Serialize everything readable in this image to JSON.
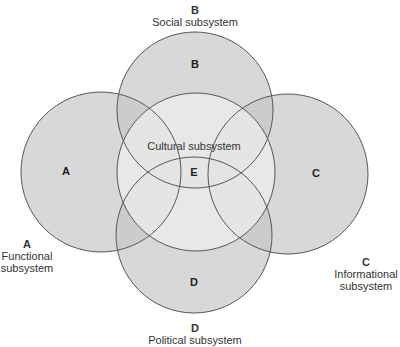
{
  "diagram": {
    "type": "venn",
    "colors": {
      "outer_fill": "#d8d8d8",
      "center_fill": "#efefef",
      "stroke": "#555555",
      "background": "#ffffff"
    },
    "circles": [
      {
        "id": "A",
        "letter": "A",
        "cx": 101,
        "cy": 172,
        "r": 80
      },
      {
        "id": "B",
        "letter": "B",
        "cx": 195,
        "cy": 110,
        "r": 78
      },
      {
        "id": "C",
        "letter": "C",
        "cx": 288,
        "cy": 174,
        "r": 80
      },
      {
        "id": "D",
        "letter": "D",
        "cx": 194,
        "cy": 235,
        "r": 78
      },
      {
        "id": "E",
        "letter": "E",
        "cx": 196,
        "cy": 172,
        "r": 79
      }
    ],
    "labels": {
      "B": {
        "letter": "B",
        "name": "Social subsystem"
      },
      "A": {
        "letter": "A",
        "name_line1": "Functional",
        "name_line2": "subsystem"
      },
      "C": {
        "letter": "C",
        "name_line1": "Informational",
        "name_line2": "subsystem"
      },
      "D": {
        "letter": "D",
        "name": "Political subsystem"
      },
      "E": {
        "name": "Cultural subsystem"
      }
    },
    "inner_letters": {
      "A": "A",
      "B": "B",
      "C": "C",
      "D": "D",
      "E": "E"
    }
  }
}
